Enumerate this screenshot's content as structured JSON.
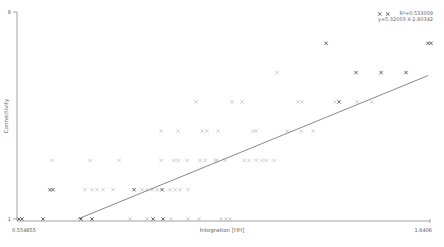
{
  "chart_data": {
    "type": "scatter",
    "title": "",
    "xlabel": "Integration [HH]",
    "ylabel": "Connectivity",
    "xlim": [
      0.554855,
      1.6406
    ],
    "ylim": [
      1,
      8
    ],
    "x_tick_labels": [
      "0.554855",
      "1.6406"
    ],
    "y_tick_labels": [
      "1",
      "8"
    ],
    "grid": false,
    "legend": null,
    "marker": "x",
    "regression": {
      "equation": "y=5.32003 X-2.80342",
      "r_squared_label": "R²=0.533009",
      "slope": 5.32003,
      "intercept": -2.80342,
      "r_squared": 0.533009
    },
    "points": [
      {
        "x": 1.5085,
        "y": 8,
        "shade": "dark"
      },
      {
        "x": 1.5295,
        "y": 8,
        "shade": "dark"
      },
      {
        "x": 1.3674,
        "y": 7,
        "shade": "dark"
      },
      {
        "x": 1.6353,
        "y": 7,
        "shade": "dark"
      },
      {
        "x": 1.6432,
        "y": 7,
        "shade": "dark"
      },
      {
        "x": 1.2385,
        "y": 6,
        "shade": "light"
      },
      {
        "x": 1.4462,
        "y": 6,
        "shade": "dark"
      },
      {
        "x": 1.512,
        "y": 6,
        "shade": "dark"
      },
      {
        "x": 1.5777,
        "y": 6,
        "shade": "dark"
      },
      {
        "x": 1.0256,
        "y": 5,
        "shade": "light"
      },
      {
        "x": 1.1202,
        "y": 5,
        "shade": "light"
      },
      {
        "x": 1.1465,
        "y": 5,
        "shade": "light"
      },
      {
        "x": 1.2937,
        "y": 5,
        "shade": "light"
      },
      {
        "x": 1.3042,
        "y": 5,
        "shade": "light"
      },
      {
        "x": 1.391,
        "y": 5,
        "shade": "light"
      },
      {
        "x": 1.4015,
        "y": 5,
        "shade": "dark"
      },
      {
        "x": 1.4488,
        "y": 5,
        "shade": "light"
      },
      {
        "x": 1.4883,
        "y": 5,
        "shade": "light"
      },
      {
        "x": 0.9336,
        "y": 4,
        "shade": "light"
      },
      {
        "x": 0.9783,
        "y": 4,
        "shade": "light"
      },
      {
        "x": 1.0414,
        "y": 4,
        "shade": "light"
      },
      {
        "x": 1.0545,
        "y": 4,
        "shade": "light"
      },
      {
        "x": 1.0834,
        "y": 4,
        "shade": "light"
      },
      {
        "x": 1.1754,
        "y": 4,
        "shade": "light"
      },
      {
        "x": 1.1833,
        "y": 4,
        "shade": "light"
      },
      {
        "x": 1.2648,
        "y": 4,
        "shade": "light"
      },
      {
        "x": 1.3016,
        "y": 4,
        "shade": "light"
      },
      {
        "x": 1.3332,
        "y": 4,
        "shade": "light"
      },
      {
        "x": 0.6469,
        "y": 3,
        "shade": "light"
      },
      {
        "x": 0.7468,
        "y": 3,
        "shade": "light"
      },
      {
        "x": 0.823,
        "y": 3,
        "shade": "light"
      },
      {
        "x": 0.9336,
        "y": 3,
        "shade": "light"
      },
      {
        "x": 0.9678,
        "y": 3,
        "shade": "light"
      },
      {
        "x": 0.9783,
        "y": 3,
        "shade": "light"
      },
      {
        "x": 1.0019,
        "y": 3,
        "shade": "light"
      },
      {
        "x": 1.0361,
        "y": 3,
        "shade": "light"
      },
      {
        "x": 1.0493,
        "y": 3,
        "shade": "light"
      },
      {
        "x": 1.0756,
        "y": 3,
        "shade": "light"
      },
      {
        "x": 1.0808,
        "y": 3,
        "shade": "light"
      },
      {
        "x": 1.1019,
        "y": 3,
        "shade": "light"
      },
      {
        "x": 1.1518,
        "y": 3,
        "shade": "light"
      },
      {
        "x": 1.1649,
        "y": 3,
        "shade": "light"
      },
      {
        "x": 1.1833,
        "y": 3,
        "shade": "light"
      },
      {
        "x": 1.1991,
        "y": 3,
        "shade": "light"
      },
      {
        "x": 1.2096,
        "y": 3,
        "shade": "light"
      },
      {
        "x": 1.2306,
        "y": 3,
        "shade": "light"
      },
      {
        "x": 0.6417,
        "y": 2,
        "shade": "dark"
      },
      {
        "x": 0.6496,
        "y": 2,
        "shade": "dark"
      },
      {
        "x": 0.7337,
        "y": 2,
        "shade": "light"
      },
      {
        "x": 0.7521,
        "y": 2,
        "shade": "light"
      },
      {
        "x": 0.7652,
        "y": 2,
        "shade": "light"
      },
      {
        "x": 0.781,
        "y": 2,
        "shade": "light"
      },
      {
        "x": 0.8073,
        "y": 2,
        "shade": "light"
      },
      {
        "x": 0.8625,
        "y": 2,
        "shade": "dark"
      },
      {
        "x": 0.8836,
        "y": 2,
        "shade": "light"
      },
      {
        "x": 0.8967,
        "y": 2,
        "shade": "light"
      },
      {
        "x": 0.9099,
        "y": 2,
        "shade": "light"
      },
      {
        "x": 0.923,
        "y": 2,
        "shade": "light"
      },
      {
        "x": 0.9362,
        "y": 2,
        "shade": "dark"
      },
      {
        "x": 0.9572,
        "y": 2,
        "shade": "light"
      },
      {
        "x": 0.9704,
        "y": 2,
        "shade": "light"
      },
      {
        "x": 0.9835,
        "y": 2,
        "shade": "light"
      },
      {
        "x": 1.0046,
        "y": 2,
        "shade": "light"
      },
      {
        "x": 0.5601,
        "y": 1,
        "shade": "dark"
      },
      {
        "x": 0.568,
        "y": 1,
        "shade": "dark"
      },
      {
        "x": 0.6232,
        "y": 1,
        "shade": "dark"
      },
      {
        "x": 0.7231,
        "y": 1,
        "shade": "dark"
      },
      {
        "x": 0.7521,
        "y": 1,
        "shade": "dark"
      },
      {
        "x": 0.852,
        "y": 1,
        "shade": "light"
      },
      {
        "x": 0.8967,
        "y": 1,
        "shade": "light"
      },
      {
        "x": 0.9125,
        "y": 1,
        "shade": "dark"
      },
      {
        "x": 0.9388,
        "y": 1,
        "shade": "dark"
      },
      {
        "x": 0.9599,
        "y": 1,
        "shade": "light"
      },
      {
        "x": 1.0046,
        "y": 1,
        "shade": "light"
      },
      {
        "x": 1.0335,
        "y": 1,
        "shade": "light"
      },
      {
        "x": 1.0913,
        "y": 1,
        "shade": "light"
      },
      {
        "x": 1.1044,
        "y": 1,
        "shade": "light"
      },
      {
        "x": 1.1149,
        "y": 1,
        "shade": "light"
      }
    ]
  },
  "colors": {
    "axis": "#8a8a8a",
    "marker_dark": "#555555",
    "marker_light": "#c8c8c8",
    "regression_line": "#555555"
  }
}
